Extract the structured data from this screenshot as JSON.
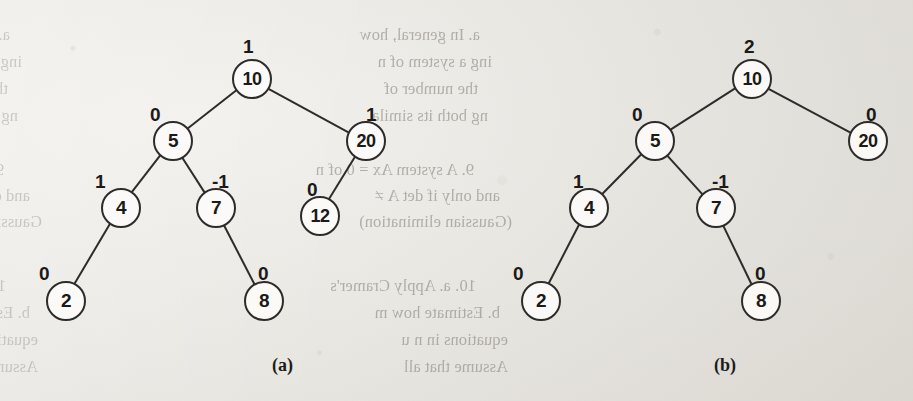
{
  "figure": {
    "kind": "binary-search-tree-pair",
    "captions": [
      {
        "id": "a",
        "label": "(a)",
        "x": 272,
        "y": 355
      },
      {
        "id": "b",
        "label": "(b)",
        "x": 714,
        "y": 355
      }
    ]
  },
  "trees": [
    {
      "id": "a",
      "caption": "(a)",
      "nodes": [
        {
          "key": "10",
          "balance": "1",
          "cx": 252,
          "cy": 79,
          "bf_x": 243,
          "bf_y": 36
        },
        {
          "key": "5",
          "balance": "0",
          "cx": 173,
          "cy": 141,
          "bf_x": 150,
          "bf_y": 104
        },
        {
          "key": "20",
          "balance": "1",
          "cx": 366,
          "cy": 141,
          "bf_x": 366,
          "bf_y": 104
        },
        {
          "key": "4",
          "balance": "1",
          "cx": 121,
          "cy": 208,
          "bf_x": 95,
          "bf_y": 171
        },
        {
          "key": "7",
          "balance": "-1",
          "cx": 216,
          "cy": 208,
          "bf_x": 212,
          "bf_y": 171
        },
        {
          "key": "12",
          "balance": "0",
          "cx": 320,
          "cy": 216,
          "bf_x": 307,
          "bf_y": 179
        },
        {
          "key": "2",
          "balance": "0",
          "cx": 66,
          "cy": 301,
          "bf_x": 39,
          "bf_y": 263
        },
        {
          "key": "8",
          "balance": "0",
          "cx": 264,
          "cy": 301,
          "bf_x": 258,
          "bf_y": 263
        }
      ],
      "edges": [
        {
          "from": "10",
          "to": "5"
        },
        {
          "from": "10",
          "to": "20"
        },
        {
          "from": "5",
          "to": "4"
        },
        {
          "from": "5",
          "to": "7"
        },
        {
          "from": "20",
          "to": "12"
        },
        {
          "from": "4",
          "to": "2"
        },
        {
          "from": "7",
          "to": "8"
        }
      ]
    },
    {
      "id": "b",
      "caption": "(b)",
      "nodes": [
        {
          "key": "10",
          "balance": "2",
          "cx": 752,
          "cy": 79,
          "bf_x": 744,
          "bf_y": 36
        },
        {
          "key": "5",
          "balance": "0",
          "cx": 655,
          "cy": 141,
          "bf_x": 632,
          "bf_y": 104
        },
        {
          "key": "20",
          "balance": "0",
          "cx": 868,
          "cy": 141,
          "bf_x": 866,
          "bf_y": 104
        },
        {
          "key": "4",
          "balance": "1",
          "cx": 589,
          "cy": 208,
          "bf_x": 573,
          "bf_y": 171
        },
        {
          "key": "7",
          "balance": "-1",
          "cx": 716,
          "cy": 208,
          "bf_x": 712,
          "bf_y": 171
        },
        {
          "key": "2",
          "balance": "0",
          "cx": 541,
          "cy": 301,
          "bf_x": 513,
          "bf_y": 263
        },
        {
          "key": "8",
          "balance": "0",
          "cx": 761,
          "cy": 301,
          "bf_x": 755,
          "bf_y": 263
        }
      ],
      "edges": [
        {
          "from": "10",
          "to": "5"
        },
        {
          "from": "10",
          "to": "20"
        },
        {
          "from": "5",
          "to": "4"
        },
        {
          "from": "5",
          "to": "7"
        },
        {
          "from": "4",
          "to": "2"
        },
        {
          "from": "7",
          "to": "8"
        }
      ]
    }
  ],
  "background_text": {
    "note": "faint show-through text from the reverse side of the scanned page (mirrored)",
    "lines": [
      {
        "text": "a. In general, how many multiplications are made by this me",
        "x": 10,
        "y": 25,
        "side": "left"
      },
      {
        "text": "ing a system of n equations in n unknowns? How does th",
        "x": 22,
        "y": 52,
        "side": "left"
      },
      {
        "text": "the number of multiplications made by the Gaussian elim",
        "x": 8,
        "y": 79,
        "side": "left"
      },
      {
        "text": "ng both its simultaneous and back-substitution aspects?",
        "x": 18,
        "y": 106,
        "side": "left"
      },
      {
        "text": "9. A system Ax = 0 of n linear equations in n unknowns has a un",
        "x": 4,
        "y": 160,
        "side": "left"
      },
      {
        "text": "and only if det A ≠ 0. Is it possible to check this condition",
        "x": 30,
        "y": 186,
        "side": "left"
      },
      {
        "text": "Gaussian elimination in a system",
        "x": 42,
        "y": 212,
        "side": "left"
      },
      {
        "text": "10. a. Apply Cramer's rule to solve the system in Problem 1 of t",
        "x": 6,
        "y": 276,
        "side": "left"
      },
      {
        "text": "b. Estimate how many times longer it will take to solve a",
        "x": 30,
        "y": 303,
        "side": "left"
      },
      {
        "text": "equations in n unknowns by Cramer's rule than by Gauss",
        "x": 38,
        "y": 330,
        "side": "left"
      },
      {
        "text": "Assume that all the determinants in Cramer's rule formula",
        "x": 38,
        "y": 357,
        "side": "left"
      },
      {
        "text": "a. In general, how",
        "x": 480,
        "y": 25,
        "side": "right"
      },
      {
        "text": "ing a system of n",
        "x": 492,
        "y": 52,
        "side": "right"
      },
      {
        "text": "the number of",
        "x": 478,
        "y": 79,
        "side": "right"
      },
      {
        "text": "ng both its simila",
        "x": 488,
        "y": 106,
        "side": "right"
      },
      {
        "text": "9. A system Ax = 0 of n",
        "x": 474,
        "y": 160,
        "side": "right"
      },
      {
        "text": "and only if det A ≠",
        "x": 500,
        "y": 186,
        "side": "right"
      },
      {
        "text": "(Gaussian elimination)",
        "x": 512,
        "y": 212,
        "side": "right"
      },
      {
        "text": "10. a. Apply Cramer's",
        "x": 476,
        "y": 276,
        "side": "right"
      },
      {
        "text": "b. Estimate how m",
        "x": 500,
        "y": 303,
        "side": "right"
      },
      {
        "text": "equations in n u",
        "x": 508,
        "y": 330,
        "side": "right"
      },
      {
        "text": "Assume that all",
        "x": 508,
        "y": 357,
        "side": "right"
      }
    ]
  },
  "colors": {
    "paper": "#e9e7e3",
    "ink": "#2e2c2a",
    "ghost_ink": "#9a958c"
  }
}
